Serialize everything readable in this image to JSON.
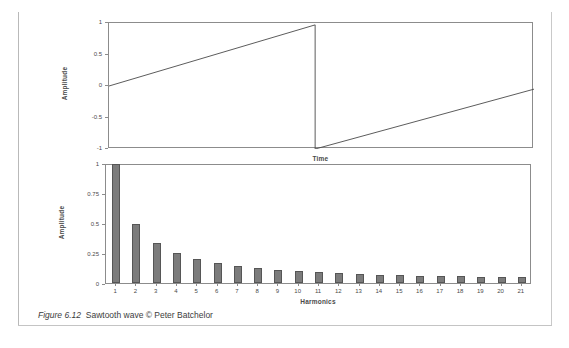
{
  "figure": {
    "caption_number": "Figure 6.12",
    "caption_text": "Sawtooth wave © Peter Batchelor"
  },
  "chart_data": [
    {
      "type": "line",
      "title": "",
      "xlabel": "Time",
      "ylabel": "Amplitude",
      "ylim": [
        -1,
        1
      ],
      "yticks": [
        "1",
        "0.5",
        "0",
        "-0.5",
        "-1"
      ],
      "ytick_values": [
        1,
        0.5,
        0,
        -0.5,
        -1
      ],
      "grid": false,
      "legend": "none",
      "series": [
        {
          "name": "sawtooth",
          "comment": "ramp from 0 to 1, vertical drop to -1, ramp up to ~-0.05",
          "x": [
            0,
            0.485,
            0.485,
            1.0
          ],
          "y": [
            0,
            0.97,
            -1.03,
            -0.05
          ]
        }
      ]
    },
    {
      "type": "bar",
      "title": "",
      "xlabel": "Harmonics",
      "ylabel": "Amplitude",
      "ylim": [
        0,
        1
      ],
      "yticks": [
        "1",
        "0.75",
        "0.5",
        "0.25",
        "0"
      ],
      "ytick_values": [
        1,
        0.75,
        0.5,
        0.25,
        0
      ],
      "grid": false,
      "legend": "none",
      "categories": [
        "1",
        "2",
        "3",
        "4",
        "5",
        "6",
        "7",
        "8",
        "9",
        "10",
        "11",
        "12",
        "13",
        "14",
        "15",
        "16",
        "17",
        "18",
        "19",
        "20",
        "21"
      ],
      "values": [
        1.0,
        0.5,
        0.333,
        0.25,
        0.2,
        0.167,
        0.143,
        0.125,
        0.111,
        0.1,
        0.091,
        0.083,
        0.077,
        0.071,
        0.067,
        0.063,
        0.059,
        0.056,
        0.053,
        0.05,
        0.048
      ]
    }
  ],
  "colors": {
    "bar_fill": "#7c7c7c",
    "bar_stroke": "#565656",
    "axis": "#8c8c8c",
    "text": "#3a3a3a"
  }
}
